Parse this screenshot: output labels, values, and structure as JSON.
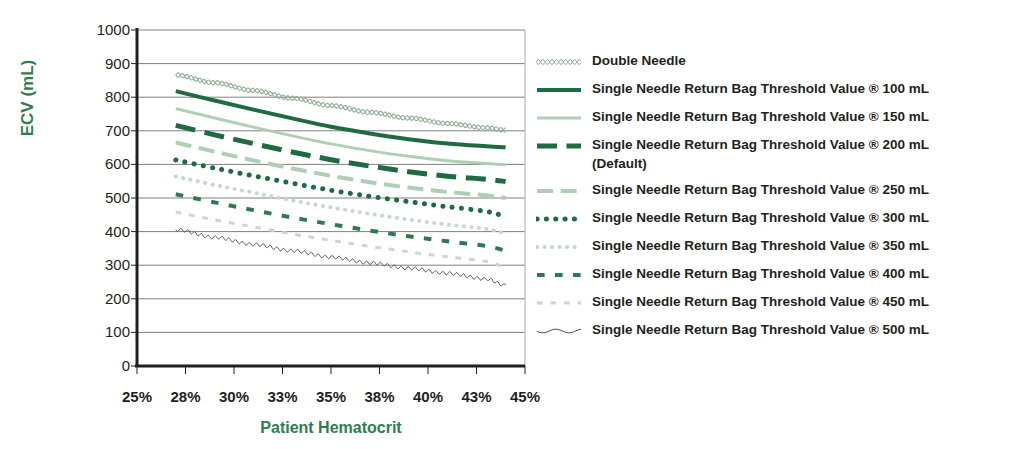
{
  "chart_data": {
    "type": "line",
    "title": "",
    "xlabel": "Patient Hematocrit",
    "ylabel": "ECV (mL)",
    "xlim": [
      25,
      45
    ],
    "ylim": [
      0,
      1000
    ],
    "grid": true,
    "legend_position": "right",
    "x_tick_labels": [
      "25%",
      "28%",
      "30%",
      "33%",
      "35%",
      "38%",
      "40%",
      "43%",
      "45%"
    ],
    "x_tick_values": [
      25,
      27.5,
      30,
      32.5,
      35,
      37.5,
      40,
      42.5,
      45
    ],
    "y_tick_labels": [
      "0",
      "100",
      "200",
      "300",
      "400",
      "500",
      "600",
      "700",
      "800",
      "900",
      "1000"
    ],
    "y_tick_values": [
      0,
      100,
      200,
      300,
      400,
      500,
      600,
      700,
      800,
      900,
      1000
    ],
    "x": [
      27,
      29,
      31,
      33,
      35,
      37,
      39,
      41,
      43,
      44
    ],
    "series": [
      {
        "name": "Double Needle",
        "style": "wavy-chain",
        "color": "#8fae96",
        "width": 2,
        "values": [
          866,
          843,
          820,
          797,
          775,
          755,
          738,
          722,
          709,
          702
        ]
      },
      {
        "name": "Single Needle Return Bag Threshold Value ® 100 mL",
        "style": "solid",
        "color": "#1e6b41",
        "width": 4,
        "values": [
          818,
          790,
          763,
          737,
          712,
          692,
          675,
          662,
          654,
          651
        ]
      },
      {
        "name": "Single Needle Return Bag Threshold Value ® 150 mL",
        "style": "solid",
        "color": "#aecfb4",
        "width": 3,
        "values": [
          766,
          738,
          711,
          685,
          661,
          641,
          624,
          611,
          603,
          599
        ]
      },
      {
        "name": "Single Needle Return Bag Threshold Value ® 200 mL\n(Default)",
        "style": "dashed-long",
        "color": "#1e6b41",
        "width": 5,
        "values": [
          716,
          688,
          662,
          637,
          614,
          595,
          578,
          565,
          556,
          549
        ]
      },
      {
        "name": "Single Needle Return Bag Threshold Value ® 250 mL",
        "style": "dashed-long",
        "color": "#aecfb4",
        "width": 4,
        "values": [
          665,
          638,
          612,
          588,
          566,
          547,
          531,
          518,
          508,
          500
        ]
      },
      {
        "name": "Single Needle Return Bag Threshold Value ® 300 mL",
        "style": "dotted-thick",
        "color": "#1e6b41",
        "width": 5,
        "values": [
          613,
          589,
          566,
          544,
          523,
          505,
          489,
          474,
          460,
          444
        ]
      },
      {
        "name": "Single Needle Return Bag Threshold Value ® 350 mL",
        "style": "dotted-thick",
        "color": "#c5d9c7",
        "width": 4,
        "values": [
          564,
          539,
          516,
          493,
          472,
          453,
          436,
          421,
          408,
          394
        ]
      },
      {
        "name": "Single Needle Return Bag Threshold Value ® 400 mL",
        "style": "dashed-short",
        "color": "#2f7a4c",
        "width": 4,
        "values": [
          511,
          487,
          464,
          442,
          422,
          403,
          386,
          371,
          357,
          343
        ]
      },
      {
        "name": "Single Needle Return Bag Threshold Value ® 450 mL",
        "style": "dashed-short",
        "color": "#c9d8c9",
        "width": 3,
        "values": [
          458,
          435,
          414,
          393,
          374,
          356,
          340,
          325,
          311,
          292
        ]
      },
      {
        "name": "Single Needle Return Bag Threshold Value ® 500 mL",
        "style": "wavy-thin",
        "color": "#4a5f4d",
        "width": 1,
        "values": [
          406,
          383,
          362,
          343,
          324,
          307,
          291,
          276,
          259,
          240
        ]
      }
    ]
  },
  "colors": {
    "axis_title": "#2e7d4f",
    "tick_text": "#231f20",
    "gridline": "#808080",
    "axis_line": "#231f20"
  }
}
